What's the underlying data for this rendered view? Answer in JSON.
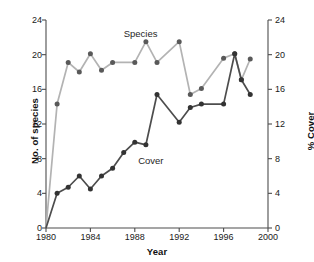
{
  "chart_data": {
    "type": "line",
    "title": "",
    "xlabel": "Year",
    "ylabel": "No. of species",
    "ylabel_right": "% Cover",
    "xlim": [
      1980,
      2000
    ],
    "ylim": [
      0,
      24
    ],
    "ylim_right": [
      0,
      24
    ],
    "xticks": [
      1980,
      1984,
      1988,
      1992,
      1996,
      2000
    ],
    "yticks": [
      0,
      4,
      8,
      12,
      16,
      20,
      24
    ],
    "yticks_right": [
      0,
      4,
      8,
      12,
      16,
      20,
      24
    ],
    "grid": false,
    "legend": "inline-annotations",
    "series": [
      {
        "name": "Species",
        "axis": "left",
        "color": "#b3b3b3",
        "marker_color": "#595959",
        "points": [
          {
            "x": 1980.0,
            "y": 0.0
          },
          {
            "x": 1981.0,
            "y": 14.3
          },
          {
            "x": 1982.0,
            "y": 19.1
          },
          {
            "x": 1983.0,
            "y": 18.0
          },
          {
            "x": 1984.0,
            "y": 20.1
          },
          {
            "x": 1985.0,
            "y": 18.2
          },
          {
            "x": 1986.0,
            "y": 19.1
          },
          {
            "x": 1988.0,
            "y": 19.1
          },
          {
            "x": 1989.0,
            "y": 21.5
          },
          {
            "x": 1990.0,
            "y": 19.1
          },
          {
            "x": 1992.0,
            "y": 21.5
          },
          {
            "x": 1993.0,
            "y": 15.4
          },
          {
            "x": 1994.0,
            "y": 16.1
          },
          {
            "x": 1996.0,
            "y": 19.6
          },
          {
            "x": 1997.0,
            "y": 20.1
          },
          {
            "x": 1997.6,
            "y": 17.1
          },
          {
            "x": 1998.4,
            "y": 19.5
          }
        ]
      },
      {
        "name": "Cover",
        "axis": "right",
        "color": "#4d4d4d",
        "marker_color": "#333333",
        "points": [
          {
            "x": 1980.0,
            "y": 0.0
          },
          {
            "x": 1981.0,
            "y": 4.0
          },
          {
            "x": 1982.0,
            "y": 4.7
          },
          {
            "x": 1983.0,
            "y": 6.0
          },
          {
            "x": 1984.0,
            "y": 4.5
          },
          {
            "x": 1985.0,
            "y": 6.0
          },
          {
            "x": 1986.0,
            "y": 6.9
          },
          {
            "x": 1987.0,
            "y": 8.7
          },
          {
            "x": 1988.0,
            "y": 9.9
          },
          {
            "x": 1989.0,
            "y": 9.6
          },
          {
            "x": 1990.0,
            "y": 15.4
          },
          {
            "x": 1992.0,
            "y": 12.2
          },
          {
            "x": 1993.0,
            "y": 13.9
          },
          {
            "x": 1994.0,
            "y": 14.3
          },
          {
            "x": 1996.0,
            "y": 14.3
          },
          {
            "x": 1997.0,
            "y": 20.1
          },
          {
            "x": 1997.6,
            "y": 17.1
          },
          {
            "x": 1998.4,
            "y": 15.4
          }
        ]
      }
    ],
    "annotations": [
      {
        "text": "Species",
        "x": 1987.0,
        "y": 22.3,
        "axis": "left"
      },
      {
        "text": "Cover",
        "x": 1988.3,
        "y": 7.6,
        "axis": "right"
      }
    ]
  }
}
